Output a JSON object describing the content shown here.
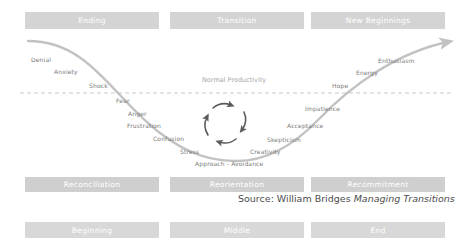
{
  "diagram": {
    "title_phases_top": [
      {
        "label": "Ending",
        "x": 25,
        "y": 12,
        "w": 134,
        "h": 17
      },
      {
        "label": "Transition",
        "x": 170,
        "y": 12,
        "w": 134,
        "h": 17
      },
      {
        "label": "New Beginnings",
        "x": 311,
        "y": 12,
        "w": 134,
        "h": 17
      }
    ],
    "title_phases_mid": [
      {
        "label": "Reconciliation",
        "x": 25,
        "y": 177,
        "w": 134,
        "h": 15
      },
      {
        "label": "Reorientation",
        "x": 170,
        "y": 177,
        "w": 134,
        "h": 15
      },
      {
        "label": "Recommitment",
        "x": 311,
        "y": 177,
        "w": 134,
        "h": 15
      }
    ],
    "title_phases_bottom": [
      {
        "label": "Beginning",
        "x": 25,
        "y": 222,
        "w": 134,
        "h": 16
      },
      {
        "label": "Middle",
        "x": 170,
        "y": 222,
        "w": 134,
        "h": 16
      },
      {
        "label": "End",
        "x": 311,
        "y": 222,
        "w": 134,
        "h": 16
      }
    ],
    "baseline_label": "Normal Productivity",
    "baseline_label_x": 202,
    "baseline_label_y": 76,
    "emotions": [
      {
        "label": "Denial",
        "x": 31,
        "y": 56
      },
      {
        "label": "Anxiety",
        "x": 54,
        "y": 68
      },
      {
        "label": "Shock",
        "x": 89,
        "y": 82
      },
      {
        "label": "Fear",
        "x": 116,
        "y": 97
      },
      {
        "label": "Anger",
        "x": 128,
        "y": 110
      },
      {
        "label": "Frustration",
        "x": 127,
        "y": 122
      },
      {
        "label": "Confusion",
        "x": 153,
        "y": 135
      },
      {
        "label": "Stress",
        "x": 180,
        "y": 148
      },
      {
        "label": "Approach - Avoidance",
        "x": 195,
        "y": 160
      },
      {
        "label": "Creativity",
        "x": 250,
        "y": 148
      },
      {
        "label": "Skepticism",
        "x": 267,
        "y": 136
      },
      {
        "label": "Acceptance",
        "x": 287,
        "y": 122
      },
      {
        "label": "Impatience",
        "x": 305,
        "y": 105
      },
      {
        "label": "Hope",
        "x": 332,
        "y": 82
      },
      {
        "label": "Energy",
        "x": 356,
        "y": 69
      },
      {
        "label": "Enthusiasm",
        "x": 378,
        "y": 57
      }
    ],
    "source": {
      "prefix": "Source: William Bridges ",
      "work": "Managing Transitions",
      "x": 238,
      "y": 193
    },
    "colors": {
      "curve": "#c2c2c2",
      "banner_top": "#d4d4d4",
      "banner_mid": "#cfcfcf",
      "banner_bottom": "#d8d8d8",
      "label_text": "#7a7a7a",
      "axis_text": "#a8a8a8",
      "dashed_line": "#b9b9c8",
      "cycle_arrow": "#5a5a5a",
      "source_text": "#4d4d4d",
      "background": "#ffffff"
    },
    "curve": {
      "description": "u-shaped change curve from upper-left down through valley to upper-right with arrowhead",
      "path": "M 28,41 C 90,41 110,96 160,133 C 190,156 215,160 237,160 C 262,160 290,150 318,120 C 350,86 395,52 452,41"
    },
    "dashed_baseline_y": 93
  }
}
